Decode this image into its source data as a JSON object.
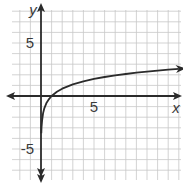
{
  "chart_data": {
    "type": "line",
    "title": "",
    "xlabel": "x",
    "ylabel": "y",
    "xlim": [
      -3,
      13
    ],
    "ylim": [
      -8,
      9
    ],
    "grid": true,
    "grid_step": 1,
    "x_tick_labels": [
      {
        "value": 5,
        "label": "5"
      }
    ],
    "y_tick_labels": [
      {
        "value": 5,
        "label": "5"
      },
      {
        "value": -5,
        "label": "-5"
      }
    ],
    "series": [
      {
        "name": "y = ln x",
        "function": "ln(x)",
        "x": [
          0.03,
          0.05,
          0.1,
          0.2,
          0.3,
          0.5,
          0.75,
          1,
          1.5,
          2,
          3,
          4,
          5,
          6,
          7,
          8,
          9,
          10,
          11,
          12,
          13
        ],
        "y": [
          -3.51,
          -3.0,
          -2.3,
          -1.61,
          -1.2,
          -0.69,
          -0.29,
          0,
          0.41,
          0.69,
          1.1,
          1.39,
          1.61,
          1.79,
          1.95,
          2.08,
          2.2,
          2.3,
          2.4,
          2.48,
          2.56
        ],
        "color": "#2b2b2b"
      }
    ],
    "colors": {
      "axis": "#2b2b2b",
      "grid": "#c8c8c8",
      "curve": "#2b2b2b"
    }
  }
}
